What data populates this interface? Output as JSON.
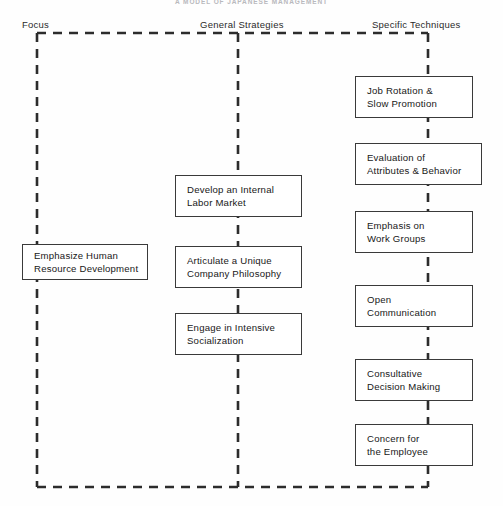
{
  "title": "A MODEL OF JAPANESE MANAGEMENT",
  "columns": [
    {
      "id": "focus",
      "label": "Focus"
    },
    {
      "id": "general",
      "label": "General Strategies"
    },
    {
      "id": "specific",
      "label": "Specific Techniques"
    }
  ],
  "nodes": {
    "focus": [
      {
        "line1": "Emphasize Human",
        "line2": "Resource Development"
      }
    ],
    "general": [
      {
        "line1": "Develop an Internal",
        "line2": "Labor Market"
      },
      {
        "line1": "Articulate a Unique",
        "line2": "Company Philosophy"
      },
      {
        "line1": "Engage in Intensive",
        "line2": "Socialization"
      }
    ],
    "specific": [
      {
        "line1": "Job Rotation &",
        "line2": "Slow Promotion"
      },
      {
        "line1": "Evaluation of",
        "line2": "Attributes & Behavior"
      },
      {
        "line1": "Emphasis on",
        "line2": "Work Groups"
      },
      {
        "line1": "Open",
        "line2": "Communication"
      },
      {
        "line1": "Consultative",
        "line2": "Decision Making"
      },
      {
        "line1": "Concern for",
        "line2": "the Employee"
      }
    ]
  },
  "style": {
    "line_color": "#2c2c2c",
    "box_border": "#3a3a3a",
    "background": "#fefefe",
    "dash_pattern": "9 7"
  }
}
